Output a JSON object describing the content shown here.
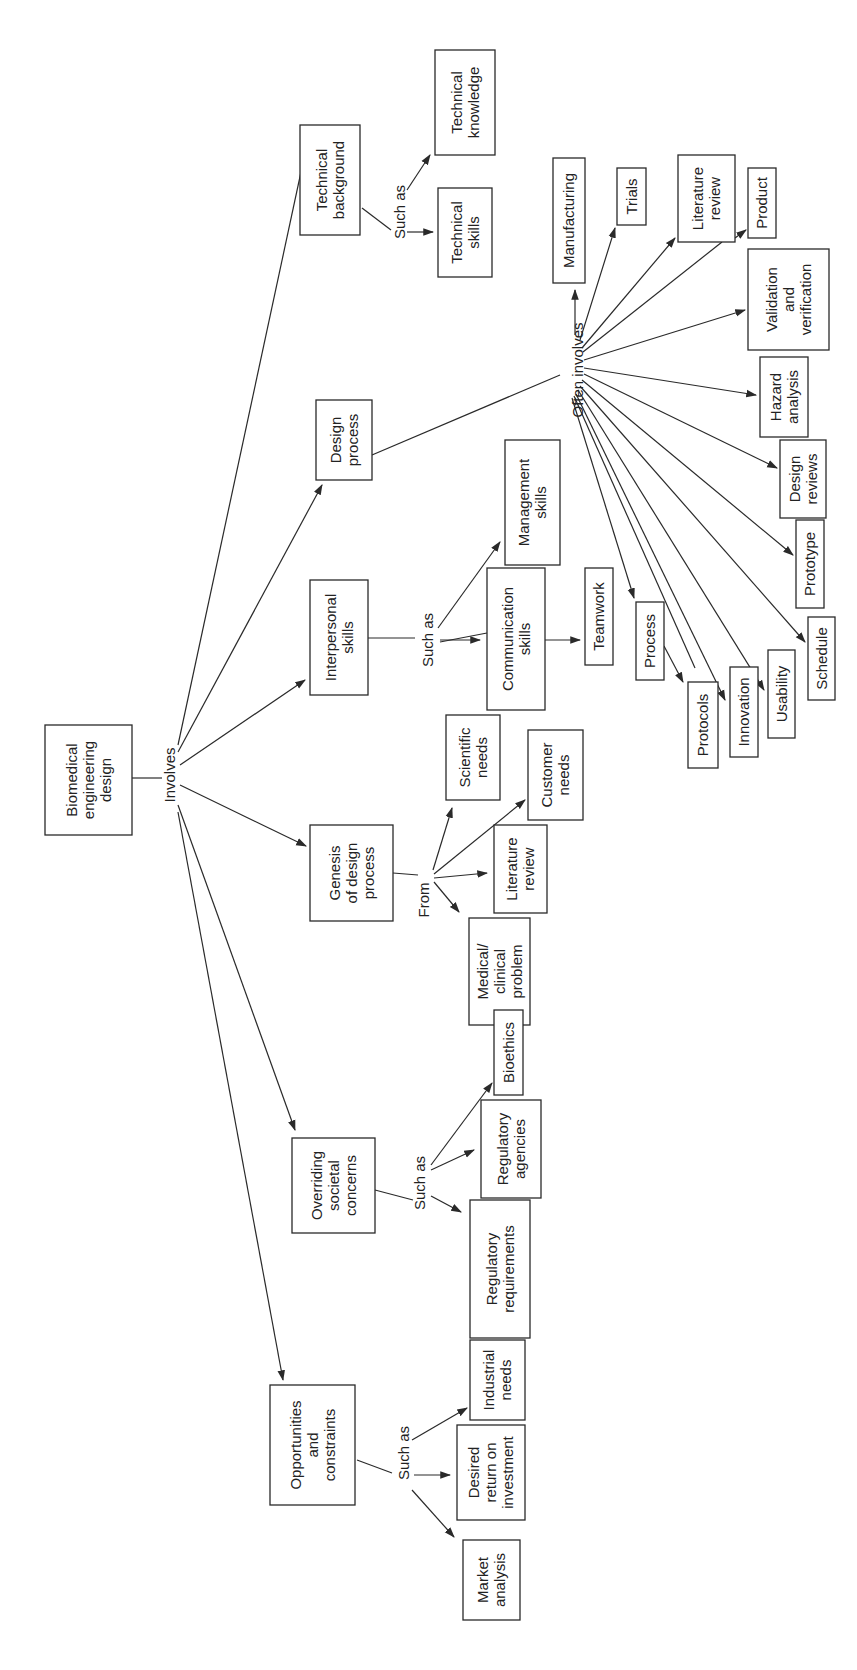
{
  "orientation": "rotated-90-ccw",
  "colors": {
    "ink": "#2a2a2a",
    "background": "#ffffff"
  },
  "nodes": {
    "root": [
      "Biomedical",
      "engineering",
      "design"
    ],
    "technical_background": [
      "Technical",
      "background"
    ],
    "technical_knowledge": [
      "Technical",
      "knowledge"
    ],
    "technical_skills": [
      "Technical",
      "skills"
    ],
    "design_process": [
      "Design",
      "process"
    ],
    "interpersonal_skills": [
      "Interpersonal",
      "skills"
    ],
    "genesis": [
      "Genesis",
      "of design",
      "process"
    ],
    "societal": [
      "Overriding",
      "societal",
      "concerns"
    ],
    "opportunities": [
      "Opportunities",
      "and",
      "constraints"
    ],
    "manufacturing": [
      "Manufacturing"
    ],
    "trials": [
      "Trials"
    ],
    "literature_review_dp": [
      "Literature",
      "review"
    ],
    "product": [
      "Product"
    ],
    "validation": [
      "Validation",
      "and",
      "verification"
    ],
    "hazard": [
      "Hazard",
      "analysis"
    ],
    "design_reviews": [
      "Design",
      "reviews"
    ],
    "prototype": [
      "Prototype"
    ],
    "schedule": [
      "Schedule"
    ],
    "usability": [
      "Usability"
    ],
    "innovation": [
      "Innovation"
    ],
    "protocols": [
      "Protocols"
    ],
    "process": [
      "Process"
    ],
    "teamwork": [
      "Teamwork"
    ],
    "communication": [
      "Communication",
      "skills"
    ],
    "management": [
      "Management",
      "skills"
    ],
    "scientific_needs": [
      "Scientific",
      "needs"
    ],
    "customer_needs": [
      "Customer",
      "needs"
    ],
    "literature_review_gen": [
      "Literature",
      "review"
    ],
    "medical_problem": [
      "Medical/",
      "clinical",
      "problem"
    ],
    "bioethics": [
      "Bioethics"
    ],
    "regulatory_agencies": [
      "Regulatory",
      "agencies"
    ],
    "regulatory_requirements": [
      "Regulatory",
      "requirements"
    ],
    "industrial_needs": [
      "Industrial",
      "needs"
    ],
    "return_on_investment": [
      "Desired",
      "return on",
      "investment"
    ],
    "market_analysis": [
      "Market",
      "analysis"
    ]
  },
  "connectors": {
    "involves": "Involves",
    "such_as_tech": "Such as",
    "often_involves": "Often involves",
    "such_as_interpersonal": "Such as",
    "from": "From",
    "such_as_societal": "Such as",
    "such_as_opportunities": "Such as"
  }
}
